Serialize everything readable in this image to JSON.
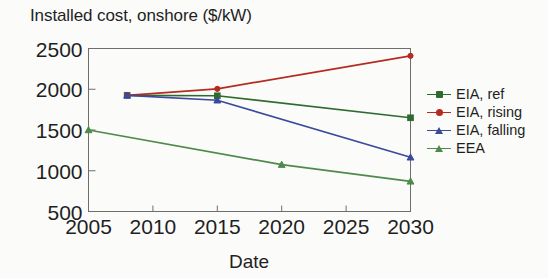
{
  "chart_data": {
    "type": "line",
    "title": "Installed cost, onshore ($/kW)",
    "xlabel": "Date",
    "ylabel": "",
    "xlim": [
      2005,
      2030
    ],
    "ylim": [
      500,
      2500
    ],
    "xticks": [
      2005,
      2010,
      2015,
      2020,
      2025,
      2030
    ],
    "yticks": [
      500,
      1000,
      1500,
      2000,
      2500
    ],
    "xtick_labels": [
      "2005",
      "2010",
      "2015",
      "2020",
      "2025",
      "2030"
    ],
    "ytick_labels": [
      "500",
      "1000",
      "1500",
      "2000",
      "2500"
    ],
    "grid": false,
    "legend_position": "right",
    "series": [
      {
        "name": "EIA, ref",
        "color": "#2f6b2f",
        "marker": "square",
        "x": [
          2008,
          2015,
          2030
        ],
        "values": [
          1925,
          1920,
          1650
        ]
      },
      {
        "name": "EIA, rising",
        "color": "#b62a20",
        "marker": "circle",
        "x": [
          2008,
          2015,
          2030
        ],
        "values": [
          1925,
          2005,
          2410
        ]
      },
      {
        "name": "EIA, falling",
        "color": "#3b4a9c",
        "marker": "triangle",
        "x": [
          2008,
          2015,
          2030
        ],
        "values": [
          1925,
          1865,
          1165
        ]
      },
      {
        "name": "EEA",
        "color": "#4e8a4a",
        "marker": "triangle",
        "x": [
          2005,
          2020,
          2030
        ],
        "values": [
          1500,
          1075,
          870
        ]
      }
    ]
  },
  "legend": {
    "items": [
      {
        "label": "EIA, ref"
      },
      {
        "label": "EIA, rising"
      },
      {
        "label": "EIA, falling"
      },
      {
        "label": "EEA"
      }
    ]
  },
  "axes": {
    "frame_color": "#6e6e6e"
  }
}
